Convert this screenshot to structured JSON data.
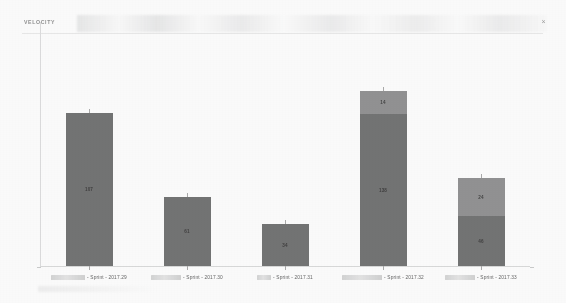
{
  "panel": {
    "title": "VELOCITY",
    "close_label": "×",
    "close_icon": "close-icon"
  },
  "chart_data": {
    "type": "bar",
    "title": "VELOCITY",
    "xlabel": "",
    "ylabel": "",
    "grid": false,
    "legend_position": "none",
    "stacked": true,
    "ylim": [
      0,
      160
    ],
    "categories": [
      "Sprint - 2017.29",
      "Sprint - 2017.30",
      "Sprint - 2017.31",
      "Sprint - 2017.32",
      "Sprint - 2017.33"
    ],
    "series": [
      {
        "name": "Committed",
        "color": "#6e6f71",
        "values": [
          107,
          61,
          34,
          138,
          46
        ]
      },
      {
        "name": "Completed",
        "color": "#8e9093",
        "values": [
          0,
          0,
          0,
          14,
          24
        ]
      }
    ],
    "bars": [
      {
        "category": "Sprint - 2017.29",
        "redacted_prefix": true,
        "segments": [
          {
            "series": "Completed",
            "value": null,
            "label": "",
            "color": "#8e9093",
            "height_px": 0
          },
          {
            "series": "Committed",
            "value": 107,
            "label": "107",
            "color": "#6e6f71",
            "height_px": 153
          }
        ],
        "total": 107
      },
      {
        "category": "Sprint - 2017.30",
        "redacted_prefix": true,
        "segments": [
          {
            "series": "Completed",
            "value": null,
            "label": "",
            "color": "#8e9093",
            "height_px": 0
          },
          {
            "series": "Committed",
            "value": 61,
            "label": "61",
            "color": "#6e6f71",
            "height_px": 69
          }
        ],
        "total": 61
      },
      {
        "category": "Sprint - 2017.31",
        "redacted_prefix": true,
        "segments": [
          {
            "series": "Completed",
            "value": null,
            "label": "",
            "color": "#8e9093",
            "height_px": 0
          },
          {
            "series": "Committed",
            "value": 34,
            "label": "34",
            "color": "#6e6f71",
            "height_px": 42
          }
        ],
        "total": 34
      },
      {
        "category": "Sprint - 2017.32",
        "redacted_prefix": true,
        "segments": [
          {
            "series": "Completed",
            "value": 14,
            "label": "14",
            "color": "#8e9093",
            "height_px": 23
          },
          {
            "series": "Committed",
            "value": 138,
            "label": "138",
            "color": "#6e6f71",
            "height_px": 152
          }
        ],
        "total": 152
      },
      {
        "category": "Sprint - 2017.33",
        "redacted_prefix": true,
        "segments": [
          {
            "series": "Completed",
            "value": 24,
            "label": "24",
            "color": "#8e9093",
            "height_px": 38
          },
          {
            "series": "Committed",
            "value": 46,
            "label": "46",
            "color": "#6e6f71",
            "height_px": 50
          }
        ],
        "total": 70
      }
    ]
  },
  "colors": {
    "committed": "#6e6f71",
    "completed": "#8e9093",
    "axis": "#d9dbdd",
    "title_text": "#8d8f91",
    "label_text": "#5e6062",
    "background": "#ffffff"
  }
}
